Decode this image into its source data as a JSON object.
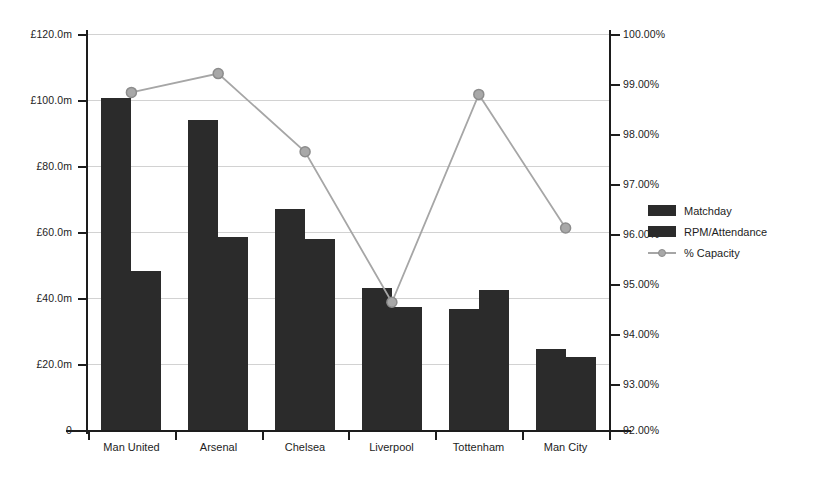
{
  "chart_data": {
    "type": "bar",
    "title": "",
    "subtitle": "",
    "xlabel": "",
    "ylabel": "",
    "categories": [
      "Man United",
      "Arsenal",
      "Chelsea",
      "Liverpool",
      "Tottenham",
      "Man City"
    ],
    "series": [
      {
        "name": "Matchday",
        "axis": "left",
        "type": "bar",
        "values": [
          100.5,
          93.8,
          67.0,
          43.0,
          36.8,
          24.6
        ]
      },
      {
        "name": "RPM/Attendance",
        "axis": "left",
        "type": "bar",
        "values": [
          48.2,
          58.4,
          57.8,
          37.4,
          42.4,
          22.2
        ]
      },
      {
        "name": "% Capacity",
        "axis": "right",
        "type": "line",
        "values": [
          98.82,
          99.2,
          97.62,
          94.58,
          98.78,
          96.08
        ]
      }
    ],
    "left_axis": {
      "ticks": [
        "£120.0m",
        "£100.0m",
        "£80.0m",
        "£60.0m",
        "£40.0m",
        "£20.0m",
        "0"
      ],
      "tick_values": [
        120,
        100,
        80,
        60,
        40,
        20,
        0
      ],
      "ylim": [
        0,
        120
      ],
      "unit": "£m"
    },
    "right_axis": {
      "ticks": [
        "100.00%",
        "99.00%",
        "98.00%",
        "97.00%",
        "96.00%",
        "95.00%",
        "94.00%",
        "93.00%",
        "92.00%"
      ],
      "tick_values": [
        100,
        99,
        98,
        97,
        96,
        95,
        94,
        93,
        92
      ],
      "ylim": [
        92,
        100
      ],
      "unit": "%"
    },
    "grid": true,
    "legend_position": "right",
    "colors": {
      "bar": "#2b2b2b",
      "line": "#a6a6a6",
      "marker_fill": "#a8a8a8",
      "marker_stroke": "#8c8c8c",
      "grid": "#d2d2d2",
      "axis": "#1d1d1d",
      "background": "#ffffff"
    }
  },
  "legend": {
    "items": [
      {
        "label": "Matchday",
        "marker": "bar-swatch-icon"
      },
      {
        "label": "RPM/Attendance",
        "marker": "bar-swatch-icon"
      },
      {
        "label": "% Capacity",
        "marker": "line-marker-icon"
      }
    ]
  }
}
